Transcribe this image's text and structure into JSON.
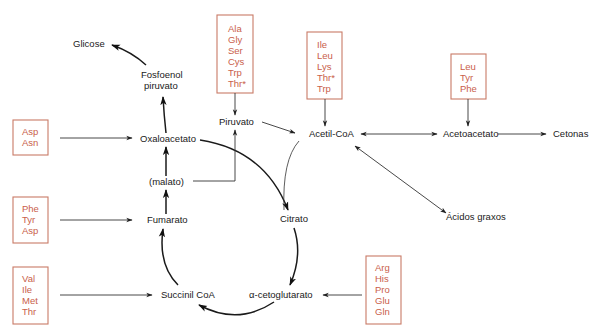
{
  "diagram": {
    "title": "",
    "metabolites": {
      "glicose": "Glicose",
      "fosfoenol_1": "Fosfoenol",
      "fosfoenol_2": "piruvato",
      "piruvato": "Piruvato",
      "acetil_coa": "Acetil-CoA",
      "acetoacetato": "Acetoacetato",
      "cetonas": "Cetonas",
      "oxaloacetato": "Oxaloacetato",
      "malato": "(malato)",
      "fumarato": "Fumarato",
      "citrato": "Citrato",
      "acidos_graxos": "Ácidos graxos",
      "succinil_coa": "Succinil CoA",
      "alfa_cetoglutarato": "α-cetoglutarato"
    },
    "amino_acid_boxes": {
      "piruvato_box": [
        "Ala",
        "Gly",
        "Ser",
        "Cys",
        "Trp",
        "Thr*"
      ],
      "acetil_coa_box": [
        "Ile",
        "Leu",
        "Lys",
        "Thr*",
        "Trp"
      ],
      "acetoacetato_box": [
        "Leu",
        "Tyr",
        "Phe"
      ],
      "oxaloacetato_box": [
        "Asp",
        "Asn"
      ],
      "fumarato_box": [
        "Phe",
        "Tyr",
        "Asp"
      ],
      "succinil_coa_box": [
        "Val",
        "Ile",
        "Met",
        "Thr"
      ],
      "cetoglutarato_box": [
        "Arg",
        "His",
        "Pro",
        "Glu",
        "Gln"
      ]
    },
    "colors": {
      "amino_acid_text": "#c9604a",
      "box_border": "#c97a66",
      "metabolite_text": "#1a1a1a",
      "arrow": "#333333"
    }
  }
}
